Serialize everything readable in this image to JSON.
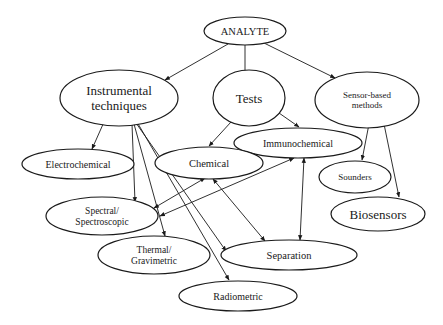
{
  "diagram": {
    "type": "flowchart",
    "title": "",
    "colors": {
      "stroke": "#1a1a1a",
      "fill": "#ffffff",
      "text": "#1a1a1a"
    },
    "nodes": [
      {
        "id": "analyte",
        "lines": [
          "ANALYTE"
        ],
        "cx": 245,
        "cy": 31,
        "rx": 41,
        "ry": 14,
        "fs": 10.5
      },
      {
        "id": "instrumental",
        "lines": [
          "Instrumental",
          "techniques"
        ],
        "cx": 119,
        "cy": 98,
        "rx": 59,
        "ry": 28,
        "fs": 13
      },
      {
        "id": "tests",
        "lines": [
          "Tests"
        ],
        "cx": 249,
        "cy": 98,
        "rx": 36,
        "ry": 28,
        "fs": 13
      },
      {
        "id": "sensor",
        "lines": [
          "Sensor-based",
          "methods"
        ],
        "cx": 367,
        "cy": 100,
        "rx": 52,
        "ry": 28,
        "fs": 9
      },
      {
        "id": "immunochemical",
        "lines": [
          "Immunochemical"
        ],
        "cx": 298,
        "cy": 143,
        "rx": 64,
        "ry": 15,
        "fs": 10
      },
      {
        "id": "electrochemical",
        "lines": [
          "Electrochemical"
        ],
        "cx": 78,
        "cy": 164,
        "rx": 56,
        "ry": 15,
        "fs": 10
      },
      {
        "id": "chemical",
        "lines": [
          "Chemical"
        ],
        "cx": 209,
        "cy": 163,
        "rx": 54,
        "ry": 16,
        "fs": 10.5
      },
      {
        "id": "sounders",
        "lines": [
          "Sounders"
        ],
        "cx": 355,
        "cy": 177,
        "rx": 36,
        "ry": 16,
        "fs": 9
      },
      {
        "id": "spectral",
        "lines": [
          "Spectral/",
          "Spectroscopic"
        ],
        "cx": 102,
        "cy": 216,
        "rx": 56,
        "ry": 19,
        "fs": 9.5
      },
      {
        "id": "biosensors",
        "lines": [
          "Biosensors"
        ],
        "cx": 378,
        "cy": 214,
        "rx": 47,
        "ry": 17,
        "fs": 13
      },
      {
        "id": "thermal",
        "lines": [
          "Thermal/",
          "Gravimetric"
        ],
        "cx": 154,
        "cy": 255,
        "rx": 56,
        "ry": 19,
        "fs": 9.5
      },
      {
        "id": "separation",
        "lines": [
          "Separation"
        ],
        "cx": 289,
        "cy": 255,
        "rx": 68,
        "ry": 15,
        "fs": 10.5
      },
      {
        "id": "radiometric",
        "lines": [
          "Radiometric"
        ],
        "cx": 238,
        "cy": 296,
        "rx": 59,
        "ry": 15,
        "fs": 10
      }
    ],
    "edges": [
      {
        "from": "analyte",
        "to": "instrumental",
        "x1": 228,
        "y1": 44,
        "x2": 165,
        "y2": 80,
        "dir": "forward"
      },
      {
        "from": "analyte",
        "to": "tests",
        "x1": 245,
        "y1": 45,
        "x2": 245,
        "y2": 78,
        "dir": "forward"
      },
      {
        "from": "analyte",
        "to": "sensor",
        "x1": 264,
        "y1": 43,
        "x2": 335,
        "y2": 78,
        "dir": "forward"
      },
      {
        "from": "instrumental",
        "to": "electrochemical",
        "x1": 104,
        "y1": 122,
        "x2": 92,
        "y2": 149,
        "dir": "forward"
      },
      {
        "from": "instrumental",
        "to": "spectral",
        "x1": 132,
        "y1": 124,
        "x2": 135,
        "y2": 202,
        "dir": "forward"
      },
      {
        "from": "instrumental",
        "to": "thermal",
        "x1": 134,
        "y1": 124,
        "x2": 165,
        "y2": 236,
        "dir": "forward"
      },
      {
        "from": "instrumental",
        "to": "separation",
        "x1": 136,
        "y1": 123,
        "x2": 226,
        "y2": 251,
        "dir": "forward"
      },
      {
        "from": "instrumental",
        "to": "radiometric",
        "x1": 137,
        "y1": 122,
        "x2": 229,
        "y2": 280,
        "dir": "forward"
      },
      {
        "from": "tests",
        "to": "chemical",
        "x1": 231,
        "y1": 122,
        "x2": 209,
        "y2": 146,
        "dir": "forward"
      },
      {
        "from": "tests",
        "to": "immunochemical",
        "x1": 279,
        "y1": 113,
        "x2": 299,
        "y2": 127,
        "dir": "forward"
      },
      {
        "from": "sensor",
        "to": "sounders",
        "x1": 369,
        "y1": 124,
        "x2": 362,
        "y2": 160,
        "dir": "forward"
      },
      {
        "from": "sensor",
        "to": "biosensors",
        "x1": 384,
        "y1": 124,
        "x2": 399,
        "y2": 197,
        "dir": "forward"
      },
      {
        "from": "spectral",
        "to": "chemical",
        "x1": 154,
        "y1": 208,
        "x2": 205,
        "y2": 178,
        "dir": "both"
      },
      {
        "from": "spectral",
        "to": "immunochemical",
        "x1": 160,
        "y1": 216,
        "x2": 294,
        "y2": 158,
        "dir": "both"
      },
      {
        "from": "chemical",
        "to": "separation",
        "x1": 213,
        "y1": 179,
        "x2": 265,
        "y2": 241,
        "dir": "both"
      },
      {
        "from": "immunochemical",
        "to": "separation",
        "x1": 304,
        "y1": 158,
        "x2": 300,
        "y2": 240,
        "dir": "both"
      }
    ]
  }
}
